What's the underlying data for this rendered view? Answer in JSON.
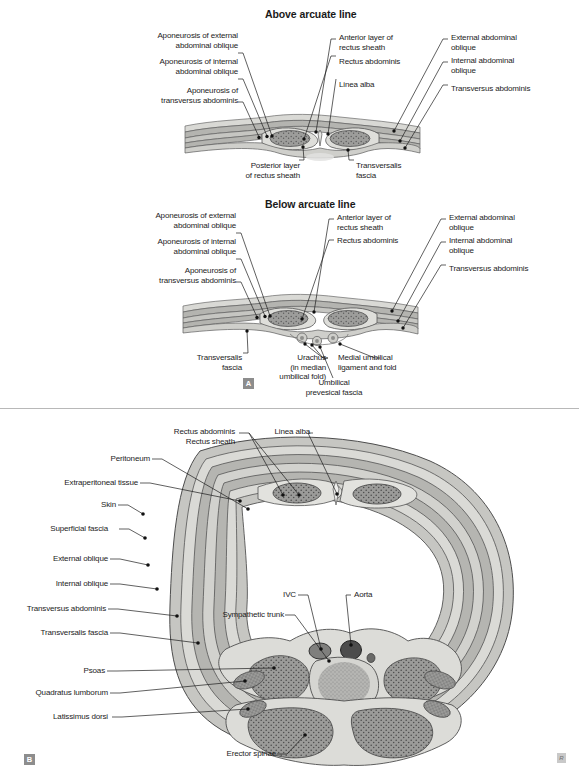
{
  "figure": {
    "panel_a_tag": "A",
    "panel_b_tag": "B",
    "corner_mark_a": "R",
    "corner_mark_b": "R"
  },
  "panel_a": {
    "sub_figures": [
      {
        "title": "Above arcuate line",
        "labels_left": [
          "Aponeurosis of external\nabdominal oblique",
          "Aponeurosis of internal\nabdominal oblique",
          "Aponeurosis of\ntransversus abdominis"
        ],
        "labels_center": [
          "Anterior layer of\nrectus sheath",
          "Rectus abdominis",
          "Linea alba"
        ],
        "labels_right": [
          "External abdominal\noblique",
          "Internal abdominal\noblique",
          "Transversus abdominis"
        ],
        "labels_bottom": [
          "Posterior layer\nof rectus sheath",
          "Transversalis\nfascia"
        ]
      },
      {
        "title": "Below arcuate line",
        "labels_left": [
          "Aponeurosis of external\nabdominal oblique",
          "Aponeurosis of internal\nabdominal oblique",
          "Aponeurosis of\ntransversus abdominis"
        ],
        "labels_center": [
          "Anterior layer of\nrectus sheath",
          "Rectus abdominis"
        ],
        "labels_right": [
          "External abdominal\noblique",
          "Internal abdominal\noblique",
          "Transversus abdominis"
        ],
        "labels_bottom": [
          "Transversalis\nfascia",
          "Urachus\n(in median\numbilical fold)",
          "Medial umbilical\nligament and fold",
          "Umbilical\nprevesical fascia"
        ]
      }
    ]
  },
  "panel_b": {
    "labels_top": [
      "Rectus abdominis",
      "Rectus sheath",
      "Linea alba"
    ],
    "labels_left": [
      "Peritoneum",
      "Extraperitoneal tissue",
      "Skin",
      "Superficial fascia",
      "External oblique",
      "Internal oblique",
      "Transversus abdominis",
      "Transversalis fascia",
      "Psoas",
      "Quadratus lumborum",
      "Latissimus dorsi"
    ],
    "labels_inner": [
      "IVC",
      "Aorta",
      "Sympathetic trunk"
    ],
    "labels_bottom": [
      "Erector spinae"
    ]
  },
  "colors": {
    "text": "#1c1c1c",
    "leader": "#1c1c1c",
    "fascia_light": "#d8d8d4",
    "fascia_mid": "#b9b9b5",
    "muscle": "#9a9a98",
    "muscle_dark": "#6e6e6e",
    "outline": "#555555",
    "panel_tag_bg": "#8d8d8d"
  }
}
